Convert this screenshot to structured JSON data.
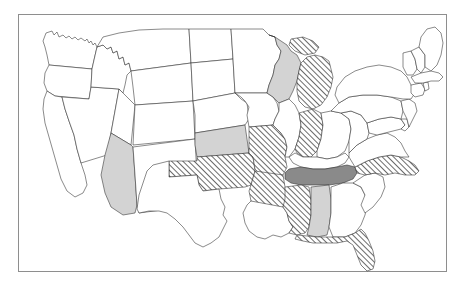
{
  "map": {
    "title": "United States choropleth map",
    "frame": {
      "visible": true,
      "border_color": "#8e8e8e"
    },
    "fill_categories": {
      "none": {
        "label": "No data",
        "color": "#ffffff",
        "pattern": "solid"
      },
      "hatched": {
        "label": "Hatched",
        "color": "#ffffff",
        "pattern": "diagonal-hatch",
        "hatch_color": "#3a3a3a"
      },
      "light_gray": {
        "label": "Light gray",
        "color": "#d3d3d3",
        "pattern": "solid"
      },
      "dark_gray": {
        "label": "Dark gray",
        "color": "#8a8a8a",
        "pattern": "solid"
      }
    },
    "stroke_color": "#2b2b2b",
    "states": [
      {
        "code": "WA",
        "name": "Washington",
        "fill": "none",
        "path": "M27 18 L33 16 L35 20 L38 17 L40 22 L44 20 L47 23 L50 21 L53 24 L56 22 L59 25 L62 23 L66 26 L68 24 L70 28 L72 26 L74 30 L76 28 L78 32 L75 45 L73 54 L30 50 L28 40 L26 32 L24 26 Z"
      },
      {
        "code": "OR",
        "name": "Oregon",
        "fill": "none",
        "path": "M30 50 L73 54 L72 72 L70 84 L36 81 L28 76 L25 68 L26 58 Z"
      },
      {
        "code": "CA",
        "name": "California",
        "fill": "none",
        "path": "M28 76 L36 81 L43 82 L46 94 L50 106 L55 120 L58 134 L62 148 L66 160 L68 170 L64 178 L56 182 L48 176 L42 164 L38 150 L34 136 L30 122 L26 108 L24 94 L25 84 Z"
      },
      {
        "code": "NV",
        "name": "Nevada",
        "fill": "none",
        "path": "M70 84 L72 72 L100 74 L96 96 L92 118 L88 140 L62 148 L58 134 L55 120 L50 106 L46 94 L43 82 Z"
      },
      {
        "code": "ID",
        "name": "Idaho",
        "fill": "none",
        "path": "M75 45 L78 32 L84 30 L88 34 L92 32 L94 38 L98 36 L100 44 L104 42 L106 50 L110 48 L112 56 L108 60 L106 70 L104 78 L100 74 L72 72 L73 54 Z"
      },
      {
        "code": "MT",
        "name": "Montana",
        "fill": "none",
        "path": "M78 32 L84 22 L100 18 L120 15 L144 14 L170 14 L172 48 L112 56 L110 48 L106 50 L104 42 L100 44 L98 36 L94 38 L92 32 L88 34 L84 30 Z"
      },
      {
        "code": "WY",
        "name": "Wyoming",
        "fill": "none",
        "path": "M112 56 L172 48 L174 86 L116 90 L114 72 Z"
      },
      {
        "code": "UT",
        "name": "Utah",
        "fill": "none",
        "path": "M100 74 L104 78 L116 90 L114 110 L112 130 L92 118 L96 96 Z"
      },
      {
        "code": "CO",
        "name": "Colorado",
        "fill": "none",
        "path": "M116 90 L174 86 L176 124 L114 130 Z"
      },
      {
        "code": "AZ",
        "name": "Arizona",
        "fill": "light_gray",
        "path": "M92 118 L112 130 L114 132 L116 160 L118 190 L116 198 L104 200 L92 192 L86 178 L82 160 L86 140 Z"
      },
      {
        "code": "NM",
        "name": "New Mexico",
        "fill": "none",
        "path": "M114 132 L176 124 L178 162 L180 190 L150 194 L120 198 L118 190 L116 160 Z"
      },
      {
        "code": "ND",
        "name": "North Dakota",
        "fill": "none",
        "path": "M170 14 L212 14 L214 44 L172 48 Z"
      },
      {
        "code": "SD",
        "name": "South Dakota",
        "fill": "none",
        "path": "M172 48 L214 44 L216 78 L174 86 Z"
      },
      {
        "code": "NE",
        "name": "Nebraska",
        "fill": "none",
        "path": "M174 86 L216 78 L222 84 L228 88 L230 104 L226 110 L176 118 L176 100 Z"
      },
      {
        "code": "KS",
        "name": "Kansas",
        "fill": "light_gray",
        "path": "M176 118 L226 110 L230 138 L178 142 L176 130 Z"
      },
      {
        "code": "OK",
        "name": "Oklahoma",
        "fill": "hatched",
        "path": "M178 142 L230 138 L234 142 L236 156 L232 170 L226 172 L200 174 L184 176 L180 170 L178 160 L150 162 L150 146 L178 146 Z"
      },
      {
        "code": "TX",
        "name": "Texas",
        "fill": "none",
        "path": "M150 146 L150 162 L178 160 L180 170 L184 176 L200 174 L202 184 L206 192 L204 200 L208 206 L204 214 L200 222 L192 228 L184 232 L176 228 L170 220 L164 212 L156 204 L148 198 L140 196 L130 196 L120 198 L118 194 L120 180 L124 168 L128 156 L134 150 Z"
      },
      {
        "code": "MN",
        "name": "Minnesota",
        "fill": "none",
        "path": "M212 14 L244 14 L250 20 L256 22 L258 30 L262 36 L260 44 L256 50 L254 60 L250 70 L248 78 L216 78 L214 44 Z"
      },
      {
        "code": "IA",
        "name": "Iowa",
        "fill": "none",
        "path": "M216 78 L248 78 L254 82 L258 88 L260 96 L256 104 L254 110 L230 112 L228 100 L230 92 L226 86 L222 82 Z"
      },
      {
        "code": "MO",
        "name": "Missouri",
        "fill": "hatched",
        "path": "M230 112 L254 110 L258 114 L262 118 L266 124 L268 132 L266 142 L268 152 L264 160 L256 162 L248 160 L240 158 L236 154 L234 142 L230 138 Z"
      },
      {
        "code": "AR",
        "name": "Arkansas",
        "fill": "hatched",
        "path": "M236 156 L264 160 L266 172 L268 184 L264 192 L256 194 L244 194 L236 192 L232 186 L230 176 L232 170 L236 156 Z"
      },
      {
        "code": "LA",
        "name": "Louisiana",
        "fill": "none",
        "path": "M232 186 L264 192 L268 198 L270 206 L274 212 L270 218 L262 222 L254 220 L246 224 L238 222 L230 216 L226 208 L224 198 L228 190 Z"
      },
      {
        "code": "WI",
        "name": "Wisconsin",
        "fill": "light_gray",
        "path": "M250 20 L256 22 L262 26 L268 30 L272 36 L278 40 L282 48 L280 56 L278 66 L274 76 L270 84 L260 88 L254 82 L248 78 L250 70 L254 60 L256 50 L260 44 L262 36 L258 30 L256 22 Z"
      },
      {
        "code": "MI",
        "name": "Michigan",
        "fill": "hatched",
        "path": "M282 48 L288 42 L296 40 L304 42 L310 46 L312 54 L314 62 L312 72 L308 82 L302 90 L294 94 L286 92 L280 86 L278 76 L278 66 L280 56 Z M272 24 L284 22 L294 26 L300 32 L296 38 L286 40 L276 36 L270 30 Z"
      },
      {
        "code": "IL",
        "name": "Illinois",
        "fill": "none",
        "path": "M260 88 L270 84 L276 90 L280 98 L282 110 L280 122 L276 134 L270 142 L266 142 L268 132 L266 124 L262 118 L258 114 L254 110 L256 104 L260 96 Z"
      },
      {
        "code": "IN",
        "name": "Indiana",
        "fill": "hatched",
        "path": "M280 98 L294 94 L302 98 L304 110 L302 124 L298 136 L292 142 L284 142 L278 138 L276 134 L280 122 L282 110 Z"
      },
      {
        "code": "OH",
        "name": "Ohio",
        "fill": "none",
        "path": "M302 98 L312 96 L322 98 L330 104 L332 114 L330 126 L326 136 L318 142 L308 144 L298 142 L298 136 L302 124 L304 110 Z"
      },
      {
        "code": "KY",
        "name": "Kentucky",
        "fill": "none",
        "path": "M276 138 L284 142 L298 142 L308 144 L318 142 L326 138 L330 142 L326 148 L318 152 L306 154 L294 154 L282 152 L274 148 L270 142 Z"
      },
      {
        "code": "TN",
        "name": "Tennessee",
        "fill": "dark_gray",
        "path": "M270 154 L282 152 L294 154 L306 154 L318 152 L328 150 L336 152 L338 158 L334 164 L324 168 L310 170 L296 170 L282 170 L272 168 L266 164 L266 158 Z"
      },
      {
        "code": "MS",
        "name": "Mississippi",
        "fill": "hatched",
        "path": "M266 172 L282 170 L290 172 L292 186 L292 200 L290 212 L286 218 L278 220 L270 218 L274 212 L270 206 L268 198 L264 192 L266 184 Z"
      },
      {
        "code": "AL",
        "name": "Alabama",
        "fill": "light_gray",
        "path": "M292 172 L310 170 L312 184 L312 198 L310 212 L308 220 L298 222 L288 220 L290 212 L292 200 L292 186 Z"
      },
      {
        "code": "GA",
        "name": "Georgia",
        "fill": "none",
        "path": "M312 172 L324 168 L334 168 L342 172 L346 180 L348 190 L346 200 L342 210 L336 218 L326 222 L314 222 L310 212 L312 198 L312 184 Z"
      },
      {
        "code": "FL",
        "name": "Florida",
        "fill": "hatched",
        "path": "M278 220 L298 222 L314 222 L326 222 L336 218 L342 214 L346 218 L350 226 L354 236 L356 246 L354 254 L348 256 L342 250 L338 240 L334 230 L328 226 L318 228 L306 228 L294 228 L284 226 L276 224 Z"
      },
      {
        "code": "SC",
        "name": "South Carolina",
        "fill": "none",
        "path": "M334 168 L346 160 L356 158 L364 162 L366 172 L362 182 L354 192 L346 198 L342 190 L346 180 L342 172 Z"
      },
      {
        "code": "NC",
        "name": "North Carolina",
        "fill": "hatched",
        "path": "M336 152 L348 146 L360 142 L372 140 L382 142 L390 146 L396 150 L400 156 L396 160 L386 160 L376 158 L366 160 L356 158 L346 160 L338 158 Z"
      },
      {
        "code": "VA",
        "name": "Virginia",
        "fill": "none",
        "path": "M330 138 L338 130 L348 124 L358 120 L368 118 L376 122 L382 128 L386 136 L390 142 L382 142 L372 140 L360 142 L348 146 L336 152 L330 142 Z"
      },
      {
        "code": "WV",
        "name": "West Virginia",
        "fill": "none",
        "path": "M322 98 L332 96 L342 100 L348 108 L350 118 L348 124 L338 130 L330 138 L330 126 L332 114 L330 104 Z"
      },
      {
        "code": "MD",
        "name": "Maryland",
        "fill": "none",
        "path": "M348 108 L360 104 L372 102 L382 104 L386 110 L382 114 L374 116 L366 118 L358 120 L350 118 Z"
      },
      {
        "code": "DE",
        "name": "Delaware",
        "fill": "none",
        "path": "M382 104 L388 104 L390 112 L386 116 L382 114 L386 110 Z"
      },
      {
        "code": "PA",
        "name": "Pennsylvania",
        "fill": "none",
        "path": "M312 96 L320 88 L330 82 L344 80 L358 80 L372 82 L382 86 L384 96 L382 104 L372 102 L360 104 L348 108 L342 100 L332 96 L322 98 Z"
      },
      {
        "code": "NJ",
        "name": "New Jersey",
        "fill": "none",
        "path": "M382 86 L390 84 L396 88 L398 96 L394 104 L390 112 L388 104 L384 96 Z"
      },
      {
        "code": "NY",
        "name": "New York",
        "fill": "none",
        "path": "M318 72 L326 62 L336 56 L348 52 L360 50 L372 52 L382 56 L388 62 L392 70 L396 78 L392 84 L384 84 L372 82 L358 80 L344 80 L330 82 L320 88 L316 80 Z"
      },
      {
        "code": "CT",
        "name": "Connecticut",
        "fill": "none",
        "path": "M392 70 L402 68 L406 74 L404 80 L396 82 L392 78 Z"
      },
      {
        "code": "RI",
        "name": "Rhode Island",
        "fill": "none",
        "path": "M404 68 L409 67 L410 74 L406 76 Z"
      },
      {
        "code": "MA",
        "name": "Massachusetts",
        "fill": "none",
        "path": "M392 62 L402 58 L412 56 L420 58 L424 62 L420 66 L412 66 L404 68 L396 68 Z"
      },
      {
        "code": "VT",
        "name": "Vermont",
        "fill": "none",
        "path": "M384 38 L392 36 L396 44 L398 54 L394 60 L388 60 L384 52 Z"
      },
      {
        "code": "NH",
        "name": "New Hampshire",
        "fill": "none",
        "path": "M392 36 L400 32 L406 40 L406 52 L402 58 L398 54 L396 44 Z"
      },
      {
        "code": "ME",
        "name": "Maine",
        "fill": "none",
        "path": "M400 32 L402 22 L408 14 L416 12 L422 18 L424 28 L422 40 L418 50 L412 56 L406 52 L406 40 Z"
      }
    ]
  }
}
